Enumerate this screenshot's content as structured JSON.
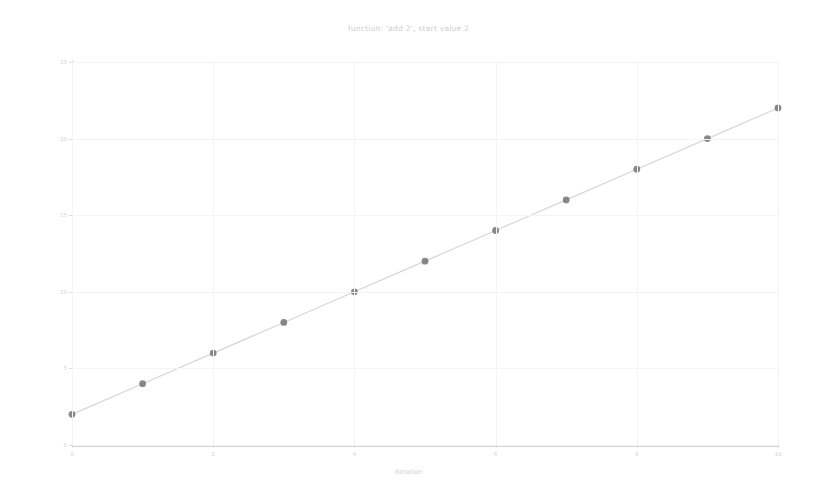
{
  "chart_data": {
    "type": "line",
    "title": "function: 'add 2', start value 2",
    "xlabel": "iteration",
    "ylabel": "output value",
    "x": [
      0,
      1,
      2,
      3,
      4,
      5,
      6,
      7,
      8,
      9,
      10
    ],
    "values": [
      2,
      4,
      6,
      8,
      10,
      12,
      14,
      16,
      18,
      20,
      22
    ],
    "series": [
      {
        "name": "output value",
        "values": [
          2,
          4,
          6,
          8,
          10,
          12,
          14,
          16,
          18,
          20,
          22
        ]
      }
    ],
    "xlim": [
      0,
      10
    ],
    "ylim": [
      0,
      25
    ],
    "xticks": [
      0,
      2,
      4,
      6,
      8,
      10
    ],
    "yticks": [
      0,
      5,
      10,
      15,
      20,
      25
    ],
    "xtick_labels": [
      "0",
      "2",
      "4",
      "6",
      "8",
      "10"
    ],
    "ytick_labels": [
      "0",
      "5",
      "10",
      "15",
      "20",
      "25"
    ],
    "grid": true,
    "legend": false,
    "marker": "circle",
    "marker_color": "#6e6e76",
    "line_color": "#d6d6dc",
    "background_color": "#ffffff"
  }
}
